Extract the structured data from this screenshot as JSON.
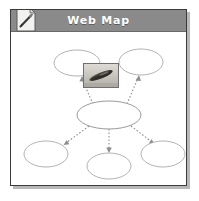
{
  "window": {
    "title": "Web Map",
    "icon": "document-pencil-icon",
    "header_color": "#8a8a8a",
    "header_text_color": "#ffffff",
    "border_color": "#3b3b3b",
    "background_color": "#ffffff"
  },
  "diagram": {
    "type": "web-map-concept-map",
    "node_stroke_color": "#a9a9a9",
    "link_color": "#8e8e8e",
    "link_style": "dotted-arrow",
    "image": {
      "name": "diagram-photo-thumbnail",
      "caption": "",
      "border_color": "#6f6f6f"
    },
    "nodes": [
      {
        "id": "top-left",
        "label": "",
        "cx": 66,
        "cy": 31,
        "rx": 23,
        "ry": 13
      },
      {
        "id": "top-right",
        "label": "",
        "cx": 130,
        "cy": 30,
        "rx": 22,
        "ry": 13
      },
      {
        "id": "center",
        "label": "",
        "cx": 98,
        "cy": 83,
        "rx": 32,
        "ry": 14
      },
      {
        "id": "bottom-left",
        "label": "",
        "cx": 35,
        "cy": 122,
        "rx": 22,
        "ry": 13
      },
      {
        "id": "bottom-center",
        "label": "",
        "cx": 98,
        "cy": 134,
        "rx": 22,
        "ry": 13
      },
      {
        "id": "bottom-right",
        "label": "",
        "cx": 152,
        "cy": 122,
        "rx": 22,
        "ry": 13
      }
    ],
    "links": [
      {
        "from": "center",
        "to": "top-left"
      },
      {
        "from": "center",
        "to": "top-right"
      },
      {
        "from": "center",
        "to": "bottom-left"
      },
      {
        "from": "center",
        "to": "bottom-center"
      },
      {
        "from": "center",
        "to": "bottom-right"
      }
    ]
  }
}
